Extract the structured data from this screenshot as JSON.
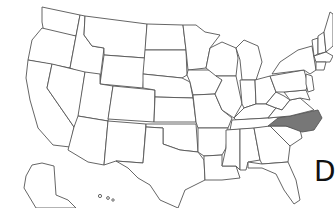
{
  "map": {
    "type": "us-states-outline",
    "highlighted_state": "North Carolina",
    "highlight_color": "#777777",
    "outline_color": "#555555",
    "background": "#ffffff",
    "insets": [
      "Alaska",
      "Hawaii"
    ]
  },
  "edge_label": "D"
}
